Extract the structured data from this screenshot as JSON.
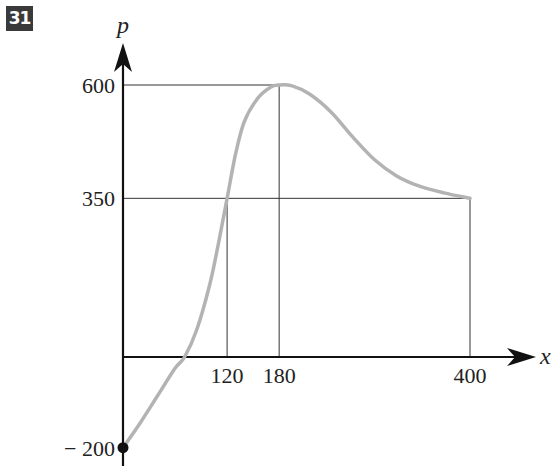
{
  "question_number": "31",
  "chart_data": {
    "type": "line",
    "title": "",
    "xlabel": "x",
    "ylabel": "p",
    "xlim": [
      0,
      400
    ],
    "ylim": [
      -200,
      600
    ],
    "grid": false,
    "x_ticks": [
      120,
      180,
      400
    ],
    "x_tick_labels": [
      "120",
      "180",
      "400"
    ],
    "y_ticks": [
      600,
      350,
      -200
    ],
    "y_tick_labels": [
      "600",
      "350",
      "− 200"
    ],
    "series": [
      {
        "name": "p(x)",
        "color": "#b3b3b3",
        "points": [
          [
            0,
            -200
          ],
          [
            20,
            -145
          ],
          [
            40,
            -85
          ],
          [
            60,
            -25
          ],
          [
            71,
            0
          ],
          [
            85,
            60
          ],
          [
            100,
            160
          ],
          [
            110,
            250
          ],
          [
            120,
            350
          ],
          [
            130,
            450
          ],
          [
            140,
            520
          ],
          [
            155,
            570
          ],
          [
            170,
            595
          ],
          [
            180,
            600
          ],
          [
            195,
            598
          ],
          [
            215,
            580
          ],
          [
            240,
            540
          ],
          [
            265,
            485
          ],
          [
            290,
            435
          ],
          [
            315,
            400
          ],
          [
            340,
            378
          ],
          [
            370,
            362
          ],
          [
            400,
            350
          ]
        ]
      }
    ],
    "reference_lines": [
      {
        "from": [
          0,
          600
        ],
        "to": [
          180,
          600
        ]
      },
      {
        "from": [
          180,
          0
        ],
        "to": [
          180,
          600
        ]
      },
      {
        "from": [
          0,
          350
        ],
        "to": [
          400,
          350
        ]
      },
      {
        "from": [
          120,
          0
        ],
        "to": [
          120,
          350
        ]
      },
      {
        "from": [
          400,
          0
        ],
        "to": [
          400,
          350
        ]
      }
    ],
    "marked_points": [
      [
        0,
        -200
      ]
    ]
  }
}
